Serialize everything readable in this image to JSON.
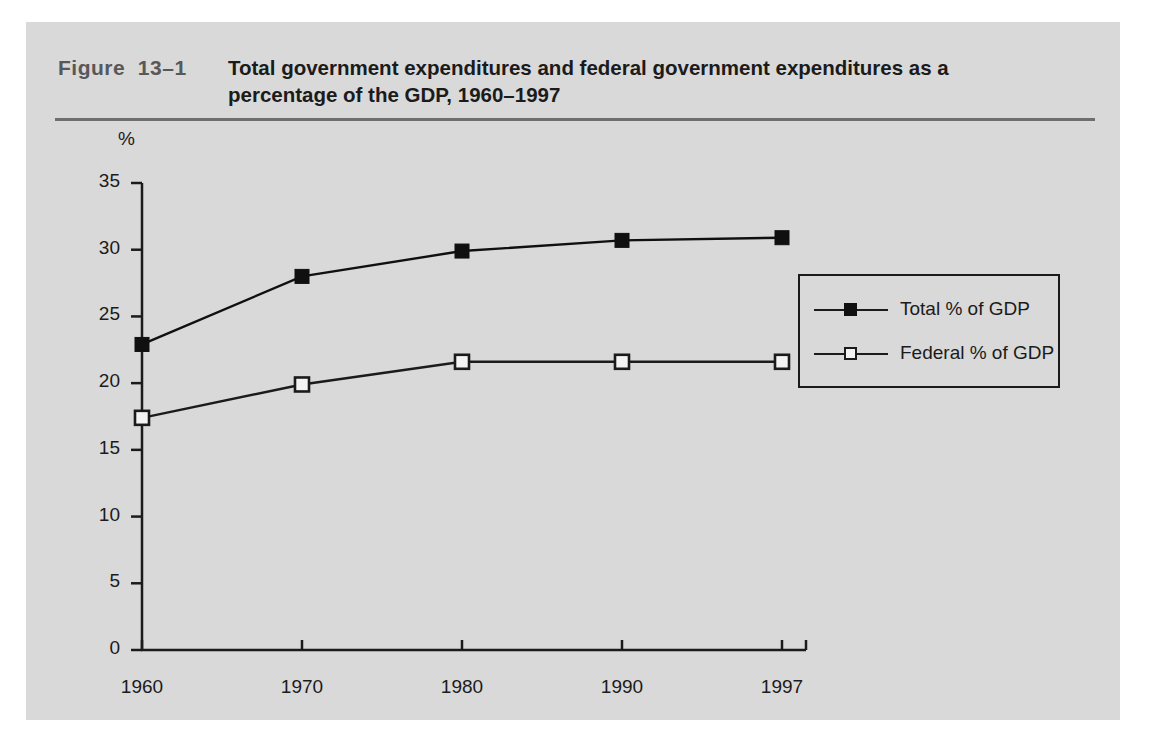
{
  "figure": {
    "number_label": "Figure  13–1",
    "title": "Total government expenditures and federal government expenditures as a percentage of the GDP, 1960–1997"
  },
  "chart_data": {
    "type": "line",
    "title": "Total government expenditures and federal government expenditures as a percentage of the GDP, 1960–1997",
    "xlabel": "",
    "ylabel": "%",
    "categories": [
      "1960",
      "1970",
      "1980",
      "1990",
      "1997"
    ],
    "x": [
      1960,
      1970,
      1980,
      1990,
      1997
    ],
    "series": [
      {
        "name": "Total % of GDP",
        "values": [
          22.9,
          28.0,
          29.9,
          30.7,
          30.9
        ],
        "marker": "filled-square",
        "color": "#101010"
      },
      {
        "name": "Federal % of GDP",
        "values": [
          17.4,
          19.9,
          21.6,
          21.6,
          21.6
        ],
        "marker": "open-square",
        "color": "#1b1b1b"
      }
    ],
    "ylim": [
      0,
      35
    ],
    "yticks": [
      0,
      5,
      10,
      15,
      20,
      25,
      30,
      35
    ],
    "ytick_labels": [
      "0",
      "5",
      "10",
      "15",
      "20",
      "25",
      "30",
      "35"
    ],
    "xtick_labels": [
      "1960",
      "1970",
      "1980",
      "1990",
      "1997"
    ],
    "grid": false,
    "legend_position": "right-inside",
    "legend_entries": [
      "Total % of GDP",
      "Federal % of GDP"
    ]
  },
  "colors": {
    "panel_background": "#d9d9d9",
    "page_background": "#ffffff",
    "axis": "#1b1b1b",
    "rule": "#6e6e70",
    "figure_number": "#58585a"
  }
}
